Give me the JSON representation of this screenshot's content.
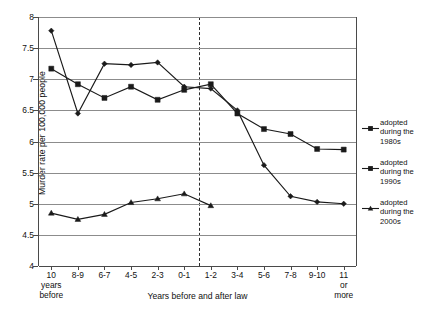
{
  "chart_data": {
    "type": "line",
    "title": "",
    "xlabel": "Years before and after law",
    "ylabel": "Murder rate per 100,000 people",
    "ylim": [
      4,
      8
    ],
    "ytick_labels": [
      "8",
      "7.5",
      "7",
      "6.5",
      "6",
      "5.5",
      "5",
      "4.5",
      "4"
    ],
    "ytick_values": [
      8,
      7.5,
      7,
      6.5,
      6,
      5.5,
      5,
      4.5,
      4
    ],
    "grid": true,
    "legend_position": "right",
    "categories": [
      "10 years before",
      "8-9",
      "6-7",
      "4-5",
      "2-3",
      "0-1",
      "1-2",
      "3-4",
      "5-6",
      "7-8",
      "9-10",
      "11 or more"
    ],
    "category_lines": [
      [
        "10",
        "years",
        "before"
      ],
      [
        "8-9"
      ],
      [
        "6-7"
      ],
      [
        "4-5"
      ],
      [
        "2-3"
      ],
      [
        "0-1"
      ],
      [
        "1-2"
      ],
      [
        "3-4"
      ],
      [
        "5-6"
      ],
      [
        "7-8"
      ],
      [
        "9-10"
      ],
      [
        "11",
        "or",
        "more"
      ]
    ],
    "annotations": [
      {
        "name": "law-adoption-divider",
        "type": "vertical-dashed-line",
        "between_categories": [
          "0-1",
          "1-2"
        ]
      }
    ],
    "series": [
      {
        "name": "adopted during the 1980s",
        "marker": "square",
        "color": "#1a1a1a",
        "values": [
          7.17,
          6.92,
          6.7,
          6.88,
          6.67,
          6.83,
          6.92,
          6.45,
          6.2,
          6.12,
          5.88,
          5.87
        ]
      },
      {
        "name": "adopted during the 1990s",
        "marker": "diamond",
        "color": "#1a1a1a",
        "values": [
          7.78,
          6.45,
          7.25,
          7.23,
          7.27,
          6.88,
          6.85,
          6.5,
          5.62,
          5.12,
          5.03,
          5.0
        ]
      },
      {
        "name": "adopted during the 2000s",
        "marker": "triangle",
        "color": "#1a1a1a",
        "values": [
          4.85,
          4.75,
          4.83,
          5.02,
          5.08,
          5.16,
          4.97,
          null,
          null,
          null,
          null,
          null
        ]
      }
    ]
  },
  "legend": {
    "entries": [
      {
        "label_lines": [
          "adopted",
          "during the",
          "1980s"
        ],
        "marker": "square"
      },
      {
        "label_lines": [
          "adopted",
          "during the",
          "1990s"
        ],
        "marker": "square"
      },
      {
        "label_lines": [
          "adopted",
          "during the",
          "2000s"
        ],
        "marker": "triangle"
      }
    ]
  }
}
